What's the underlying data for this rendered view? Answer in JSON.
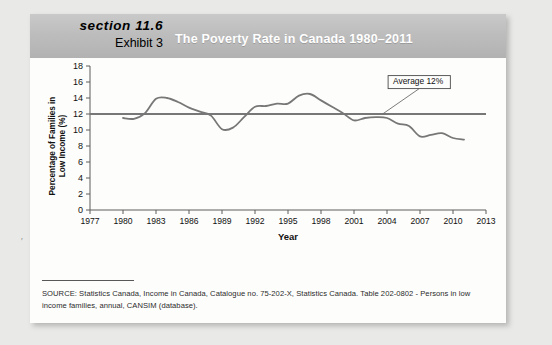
{
  "header": {
    "section_label": "section 11.6",
    "exhibit_label": "Exhibit 3",
    "title": "The Poverty Rate in Canada 1980–2011",
    "band_color": "#bdbdbd",
    "title_color": "#ffffff"
  },
  "source": {
    "text": "SOURCE: Statistics Canada, Income in Canada, Catalogue no. 75-202-X,  Statistics Canada. Table 202-0802 - Persons in low income families, annual, CANSIM (database)."
  },
  "scan_mark": "′",
  "chart_data": {
    "type": "line",
    "title": "The Poverty Rate in Canada 1980–2011",
    "xlabel": "Year",
    "ylabel": "Percentage of Families in\nLow Income (%)",
    "xlim": [
      1977,
      2013
    ],
    "ylim": [
      0,
      18
    ],
    "ytick_step": 2,
    "xtick_step": 3,
    "grid": false,
    "legend": false,
    "line_color": "#777777",
    "reference_line_color": "#777777",
    "yticks": [
      0,
      2,
      4,
      6,
      8,
      10,
      12,
      14,
      16,
      18
    ],
    "xticks": [
      1977,
      1980,
      1983,
      1986,
      1989,
      1992,
      1995,
      1998,
      2001,
      2004,
      2007,
      2010,
      2013
    ],
    "annotations": [
      {
        "name": "average-callout",
        "text": "Average 12%",
        "value": 12,
        "box_x": 2004.1,
        "box_y": 16.8,
        "leader_to_x": 2003.6,
        "leader_to_y": 12
      }
    ],
    "series": [
      {
        "name": "Percentage of families in low income",
        "x": [
          1980,
          1981,
          1982,
          1983,
          1984,
          1985,
          1986,
          1987,
          1988,
          1989,
          1990,
          1991,
          1992,
          1993,
          1994,
          1995,
          1996,
          1997,
          1998,
          1999,
          2000,
          2001,
          2002,
          2003,
          2004,
          2005,
          2006,
          2007,
          2008,
          2009,
          2010,
          2011
        ],
        "values": [
          11.5,
          11.4,
          12.1,
          13.9,
          14.0,
          13.5,
          12.8,
          12.3,
          11.8,
          10.1,
          10.3,
          11.6,
          12.9,
          13.0,
          13.3,
          13.3,
          14.3,
          14.5,
          13.7,
          12.9,
          12.1,
          11.2,
          11.5,
          11.6,
          11.5,
          10.8,
          10.5,
          9.2,
          9.4,
          9.6,
          9.0,
          8.8
        ],
        "color": "#777777"
      }
    ],
    "reference_series": [
      {
        "name": "Average 12%",
        "value": 12,
        "x_start": 1977,
        "x_end": 2013,
        "color": "#777777"
      }
    ]
  }
}
